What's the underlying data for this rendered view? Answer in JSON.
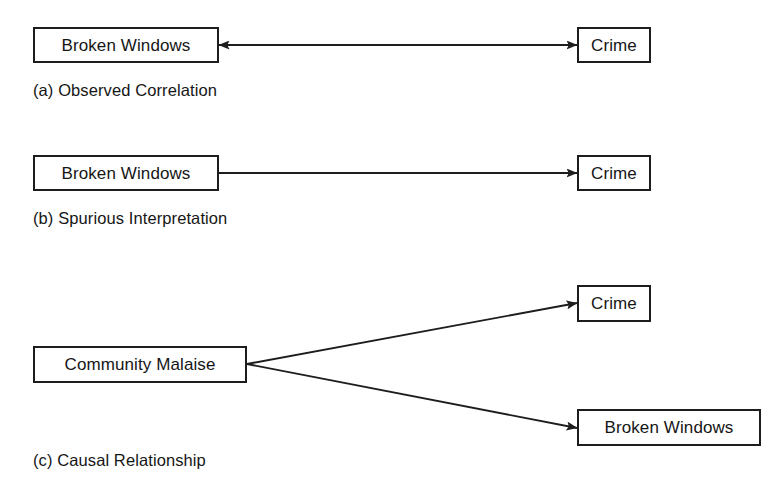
{
  "figure": {
    "background_color": "#ffffff",
    "stroke_color": "#1d1d1d",
    "text_color": "#161616",
    "panels": [
      {
        "id": "a",
        "caption": "(a) Observed Correlation",
        "nodes": [
          {
            "id": "a-broken-windows",
            "label": "Broken Windows"
          },
          {
            "id": "a-crime",
            "label": "Crime"
          }
        ],
        "edges": [
          {
            "from": "Broken Windows",
            "to": "Crime",
            "direction": "bidirectional",
            "meaning": "observed correlation"
          }
        ]
      },
      {
        "id": "b",
        "caption": "(b) Spurious Interpretation",
        "nodes": [
          {
            "id": "b-broken-windows",
            "label": "Broken Windows"
          },
          {
            "id": "b-crime",
            "label": "Crime"
          }
        ],
        "edges": [
          {
            "from": "Broken Windows",
            "to": "Crime",
            "direction": "forward",
            "meaning": "spurious causal claim"
          }
        ]
      },
      {
        "id": "c",
        "caption": "(c) Causal Relationship",
        "nodes": [
          {
            "id": "c-community-malaise",
            "label": "Community Malaise"
          },
          {
            "id": "c-crime",
            "label": "Crime"
          },
          {
            "id": "c-broken-windows",
            "label": "Broken Windows"
          }
        ],
        "edges": [
          {
            "from": "Community Malaise",
            "to": "Crime",
            "direction": "forward",
            "meaning": "common cause"
          },
          {
            "from": "Community Malaise",
            "to": "Broken Windows",
            "direction": "forward",
            "meaning": "common cause"
          }
        ]
      }
    ]
  }
}
